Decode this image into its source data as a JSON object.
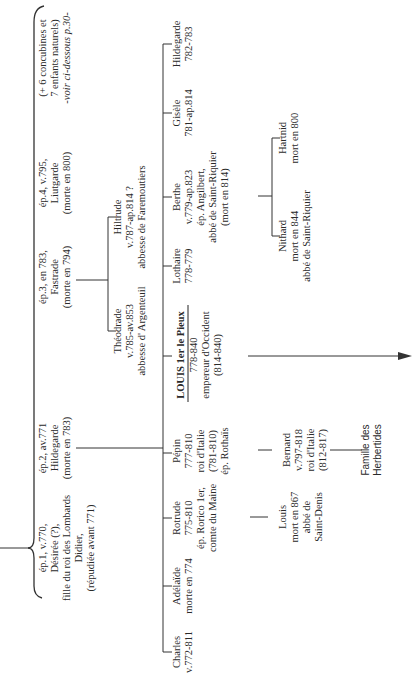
{
  "spouses": [
    {
      "id": "ep1",
      "lines": [
        "ép.1, v.770,",
        "Désirée (?),",
        "fille du roi des Lombards",
        "Didier,",
        "(répudiée avant 771)"
      ]
    },
    {
      "id": "ep2",
      "lines": [
        "ép.2, av.771",
        "Hildegarde",
        "(morte en 783)"
      ]
    },
    {
      "id": "ep3",
      "lines": [
        "ép.3, en 783,",
        "Fastrade",
        "(morte en 794)"
      ]
    },
    {
      "id": "ep4",
      "lines": [
        "ép.4, v.795,",
        "Liutgarde",
        "(morte en 800)"
      ]
    },
    {
      "id": "concubines",
      "lines": [
        "(+ 6 concubines et",
        "7 enfants naturels)",
        "-voir ci-dessous p.30-"
      ]
    }
  ],
  "children_hildegarde": [
    {
      "id": "charles",
      "lines": [
        "Charles",
        "v.772-811"
      ]
    },
    {
      "id": "adelaide",
      "lines": [
        "Adélaïde",
        "morte en 774"
      ]
    },
    {
      "id": "rotrude",
      "lines": [
        "Rotrude",
        "775-810",
        "ép. Rorico 1er,",
        "comte du Maine"
      ]
    },
    {
      "id": "pepin",
      "lines": [
        "Pépin",
        "777-810",
        "roi d'Italie",
        "(781-810)",
        "ép. Rothaïs"
      ]
    },
    {
      "id": "louis",
      "lines": [
        "LOUIS 1er le Pieux",
        "778-840",
        "empereur d'Occident",
        "(814-840)"
      ]
    },
    {
      "id": "lothaire",
      "lines": [
        "Lothaire",
        "778-779"
      ]
    },
    {
      "id": "berthe",
      "lines": [
        "Berthe",
        "v.779-ap.823",
        "ép. Angilbert,",
        "abbé de Saint-Riquier",
        "(mort en 814)"
      ]
    },
    {
      "id": "gisele",
      "lines": [
        "Gisèle",
        "781-ap.814"
      ]
    },
    {
      "id": "hildegarde_f",
      "lines": [
        "Hildegarde",
        "782-783"
      ]
    }
  ],
  "children_fastrade": [
    {
      "id": "theodrade",
      "lines": [
        "Théodrade",
        "v.785-av.853",
        "abbesse d' Argenteuil"
      ]
    },
    {
      "id": "hiltrude",
      "lines": [
        "Hiltrude",
        "v.787-ap.814 ?",
        "abbesse de Faremoutiers"
      ]
    }
  ],
  "grandchildren": [
    {
      "id": "louis_rotrude",
      "parent": "rotrude",
      "lines": [
        "Louis",
        "mort en 867",
        "abbé de",
        "Saint-Denis"
      ]
    },
    {
      "id": "bernard",
      "parent": "pepin",
      "lines": [
        "Bernard",
        "v.797-818",
        "roi d'Italie",
        "(812-817)"
      ]
    },
    {
      "id": "nithard",
      "parent": "berthe",
      "lines": [
        "Nithard",
        "mort en 844",
        "abbé de Saint-Riquier"
      ]
    },
    {
      "id": "hartnid",
      "parent": "berthe",
      "lines": [
        "Hartnid",
        "mort en 800"
      ]
    }
  ],
  "great_grandchildren": [
    {
      "id": "herbertides",
      "parent": "bernard",
      "lines": [
        "Famille des",
        "Herbertides"
      ]
    }
  ]
}
